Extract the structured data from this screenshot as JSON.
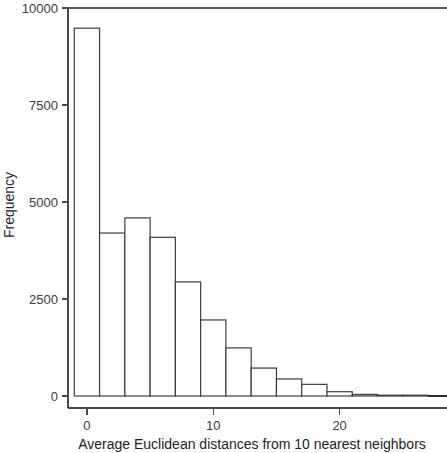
{
  "chart_data": {
    "type": "bar",
    "title": "",
    "subtitle": "",
    "xlabel": "Average Euclidean distances from 10 nearest neighbors",
    "ylabel": "Frequency",
    "xlim": [
      -1.5,
      28.5
    ],
    "ylim": [
      0,
      10000
    ],
    "grid": false,
    "legend": null,
    "bin_width": 2,
    "x_ticks": [
      0,
      10,
      20
    ],
    "x_tick_labels": [
      "0",
      "10",
      "20"
    ],
    "y_ticks": [
      0,
      2500,
      5000,
      7500,
      10000
    ],
    "y_tick_labels": [
      "0",
      "2500",
      "5000",
      "7500",
      "10000"
    ],
    "bin_edges": [
      -1,
      1,
      3,
      5,
      7,
      9,
      11,
      13,
      15,
      17,
      19,
      21,
      23,
      25,
      27
    ],
    "categories": [
      "-1 to 1",
      "1 to 3",
      "3 to 5",
      "5 to 7",
      "7 to 9",
      "9 to 11",
      "11 to 13",
      "13 to 15",
      "15 to 17",
      "17 to 19",
      "19 to 21",
      "21 to 23",
      "23 to 25",
      "25 to 27"
    ],
    "bin_centers": [
      0,
      2,
      4,
      6,
      8,
      10,
      12,
      14,
      16,
      18,
      20,
      22,
      24,
      26
    ],
    "values": [
      9480,
      4200,
      4590,
      4090,
      2940,
      1960,
      1240,
      720,
      440,
      300,
      110,
      40,
      15,
      5
    ],
    "annotations": []
  },
  "style": {
    "bar_fill": "#ffffff",
    "bar_stroke": "#3c3c3c",
    "axis_color": "#4a4a4a",
    "text_color": "#1e1e1e",
    "tick_text_color": "#3a3a3a",
    "background": "#ffffff"
  }
}
